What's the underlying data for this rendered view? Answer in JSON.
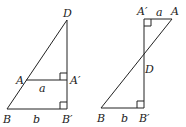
{
  "figures": [
    {
      "name": "left-figure",
      "labels": {
        "D": "D",
        "A": "A",
        "A_prime": "A′",
        "a": "a",
        "B": "B",
        "b": "b",
        "B_prime": "B′"
      }
    },
    {
      "name": "right-figure",
      "labels": {
        "A_prime": "A′",
        "a": "a",
        "A": "A",
        "D": "D",
        "B": "B",
        "b": "b",
        "B_prime": "B′"
      }
    }
  ],
  "colors": {
    "stroke": "#222222",
    "background": "#ffffff"
  }
}
